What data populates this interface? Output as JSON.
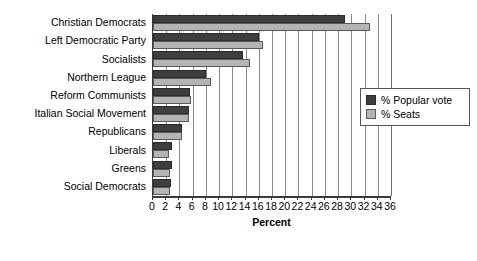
{
  "chart_data": {
    "type": "bar",
    "orientation": "horizontal",
    "title": "",
    "xlabel": "Percent",
    "ylabel": "",
    "xlim": [
      0,
      36
    ],
    "xticks": [
      0,
      2,
      4,
      6,
      8,
      10,
      12,
      14,
      16,
      18,
      20,
      22,
      24,
      26,
      28,
      30,
      32,
      34,
      36
    ],
    "grid": true,
    "legend_position": "right",
    "categories": [
      "Christian Democrats",
      "Left Democratic Party",
      "Socialists",
      "Northern League",
      "Reform Communists",
      "Italian Social Movement",
      "Republicans",
      "Liberals",
      "Greens",
      "Social Democrats"
    ],
    "series": [
      {
        "name": "% Popular vote",
        "color": "#3e3e3e",
        "values": [
          29.0,
          16.1,
          13.6,
          8.0,
          5.6,
          5.4,
          4.4,
          2.9,
          2.8,
          2.7
        ]
      },
      {
        "name": "% Seats",
        "color": "#b4b4b4",
        "values": [
          32.8,
          16.6,
          14.6,
          8.7,
          5.8,
          5.4,
          4.4,
          2.4,
          2.5,
          2.5
        ]
      }
    ]
  },
  "legend": {
    "entries": [
      {
        "label": "% Popular vote"
      },
      {
        "label": "% Seats"
      }
    ]
  },
  "axis": {
    "x_title": "Percent"
  }
}
